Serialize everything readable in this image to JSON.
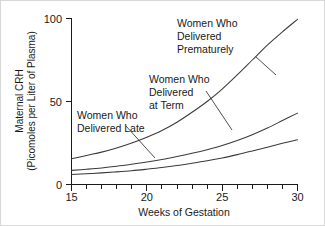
{
  "chart_data": {
    "type": "line",
    "title": "",
    "xlabel": "Weeks of Gestation",
    "ylabel_line1": "Maternal CRH",
    "ylabel_line2": "(Picomoles per Liter of Plasma)",
    "xlim": [
      15,
      30
    ],
    "ylim": [
      0,
      100
    ],
    "xticks": [
      15,
      20,
      25,
      30
    ],
    "xtick_labels": [
      "15",
      "20",
      "25",
      "30"
    ],
    "xminor_ticks": [
      16,
      17,
      18,
      19,
      21,
      22,
      23,
      24,
      26,
      27,
      28,
      29
    ],
    "yticks": [
      0,
      50,
      100
    ],
    "ytick_labels": [
      "0",
      "50",
      "100"
    ],
    "grid": false,
    "legend_position": "inline-annotations",
    "x": [
      15,
      16,
      17,
      18,
      19,
      20,
      21,
      22,
      23,
      24,
      25,
      26,
      27,
      28,
      29,
      30
    ],
    "series": [
      {
        "name": "Women Who Delivered Prematurely",
        "values": [
          15.5,
          17.5,
          19.5,
          22.0,
          25.0,
          28.5,
          32.5,
          37.5,
          43.5,
          50.0,
          57.5,
          66.0,
          75.0,
          84.0,
          92.0,
          99.5
        ]
      },
      {
        "name": "Women Who Delivered at Term",
        "values": [
          8.5,
          9.2,
          10.0,
          11.0,
          12.2,
          13.5,
          15.0,
          16.8,
          18.8,
          21.0,
          23.5,
          26.5,
          30.0,
          34.0,
          38.5,
          43.0
        ]
      },
      {
        "name": "Women Who Delivered Late",
        "values": [
          6.0,
          6.5,
          7.0,
          7.6,
          8.3,
          9.2,
          10.2,
          11.4,
          12.8,
          14.3,
          16.0,
          18.0,
          20.2,
          22.5,
          24.8,
          27.0
        ]
      }
    ],
    "annotations": [
      {
        "id": "premature",
        "lines": [
          "Women Who",
          "Delivered",
          "Prematurely"
        ],
        "text": "Women Who Delivered Prematurely",
        "points_to_series": "Women Who Delivered Prematurely"
      },
      {
        "id": "at-term",
        "lines": [
          "Women Who",
          "Delivered",
          "at Term"
        ],
        "text": "Women Who Delivered at Term",
        "points_to_series": "Women Who Delivered at Term"
      },
      {
        "id": "late",
        "lines": [
          "Women Who",
          "Delivered Late"
        ],
        "text": "Women Who Delivered Late",
        "points_to_series": "Women Who Delivered Late"
      }
    ]
  },
  "colors": {
    "background": "#ffffff",
    "axis": "#1a1a1a",
    "curve": "#3a3a3a",
    "border": "#d8d8d8"
  }
}
